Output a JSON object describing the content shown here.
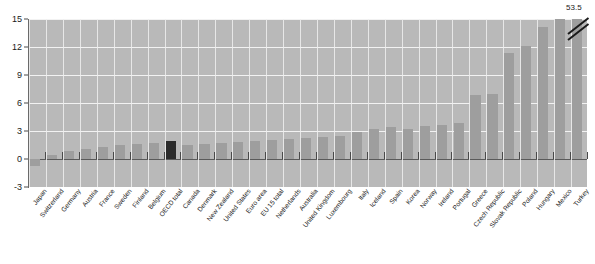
{
  "chart_data": {
    "type": "bar",
    "title": "",
    "xlabel": "",
    "ylabel": "",
    "ylim": [
      -3,
      15
    ],
    "yticks": [
      15,
      12,
      9,
      6,
      3,
      0,
      -3
    ],
    "grid": true,
    "legend": "none",
    "highlight_category": "OECD total",
    "highlight_color": "#2b2b2b",
    "bar_color": "#9e9e9e",
    "plot_background": "#b9b9b9",
    "annotations": [
      {
        "category": "Turkey",
        "text": "53.5",
        "note": "axis break, bar clipped at top of scale"
      }
    ],
    "categories": [
      "Japan",
      "Switzerland",
      "Germany",
      "Austria",
      "France",
      "Sweden",
      "Finland",
      "Belgium",
      "OECD total",
      "Canada",
      "Denmark",
      "New Zealand",
      "United States",
      "Euro area",
      "EU 15 total",
      "Netherlands",
      "Australia",
      "United Kingdom",
      "Luxembourg",
      "Italy",
      "Iceland",
      "Spain",
      "Korea",
      "Norway",
      "Ireland",
      "Portugal",
      "Greece",
      "Czech Republic",
      "Slovak Republic",
      "Poland",
      "Hungary",
      "Mexico",
      "Turkey"
    ],
    "values": [
      -0.7,
      0.4,
      0.9,
      1.1,
      1.3,
      1.5,
      1.6,
      1.7,
      1.9,
      1.5,
      1.6,
      1.7,
      1.8,
      1.9,
      2.0,
      2.1,
      2.3,
      2.4,
      2.5,
      2.9,
      3.2,
      3.4,
      3.2,
      3.5,
      3.6,
      3.9,
      6.9,
      7.0,
      11.4,
      12.1,
      14.1,
      15.0,
      53.5
    ]
  }
}
